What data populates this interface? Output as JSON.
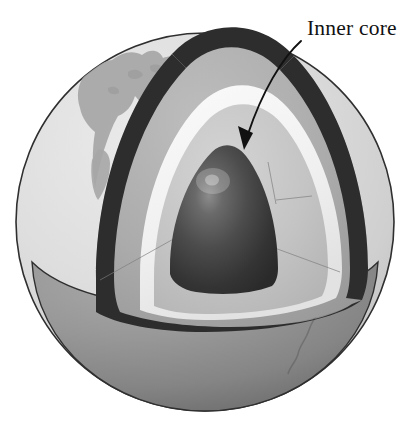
{
  "figure": {
    "title_text": "Inner core",
    "background_color": "#ffffff"
  },
  "annotations": [
    {
      "id": "inner-core",
      "label": "Inner core",
      "label_x": 307,
      "label_y": 35,
      "arrow_from_x": 300,
      "arrow_from_y": 42,
      "arrow_to_x": 243,
      "arrow_to_y": 148,
      "color": "#111111"
    }
  ],
  "layers": [
    {
      "name": "crust",
      "label": "crust",
      "color": "#2b2b2b"
    },
    {
      "name": "surface",
      "label": "surface",
      "color": "#dcdcdc"
    },
    {
      "name": "continent",
      "label": "continent",
      "color": "#a8a8a8"
    },
    {
      "name": "mantle",
      "label": "mantle",
      "color": "#b0b0b0"
    },
    {
      "name": "outer-core-boundary",
      "label": "outer core boundary",
      "color": "#f2f2f2"
    },
    {
      "name": "outer-core",
      "label": "outer core",
      "color": "#c4c4c4"
    },
    {
      "name": "inner-core",
      "label": "inner core",
      "color": "#3a3a3a"
    },
    {
      "name": "lower-hemisphere",
      "label": "lower hemisphere",
      "color": "#8e8e8e"
    },
    {
      "name": "cut-face",
      "label": "cut face",
      "color": "#9a9a9a"
    }
  ],
  "geometry": {
    "sphere_center_x": 205,
    "sphere_center_y": 222,
    "sphere_radius": 190,
    "inner_core_center_x": 222,
    "inner_core_center_y": 195,
    "inner_core_radius": 53,
    "highlight_x": 212,
    "highlight_y": 180
  }
}
